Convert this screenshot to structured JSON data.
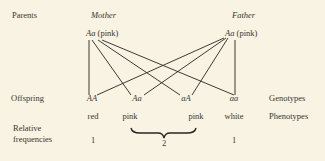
{
  "row_labels": {
    "parents": "Parents",
    "offspring": "Offspring",
    "relative_frequencies_line1": "Relative",
    "relative_frequencies_line2": "frequencies"
  },
  "parents": {
    "mother": {
      "title": "Mother",
      "genotype": "Aa",
      "phenotype": "(pink)"
    },
    "father": {
      "title": "Father",
      "genotype": "Aa",
      "phenotype": "(pink)"
    }
  },
  "offspring": [
    {
      "genotype": "AA",
      "phenotype": "red"
    },
    {
      "genotype": "Aa",
      "phenotype": "pink"
    },
    {
      "genotype": "aA",
      "phenotype": "pink"
    },
    {
      "genotype": "aa",
      "phenotype": "white"
    }
  ],
  "frequencies": {
    "red": "1",
    "pink_combined": "2",
    "white": "1"
  },
  "right_labels": {
    "genotypes": "Genotypes",
    "phenotypes": "Phenotypes"
  },
  "colors": {
    "background": "#f8f3e3",
    "ink": "#2a2622"
  }
}
